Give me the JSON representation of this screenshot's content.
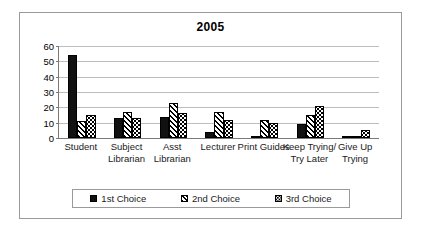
{
  "chart_data": {
    "type": "bar",
    "title": "2005",
    "xlabel": "",
    "ylabel": "",
    "ylim": [
      0,
      60
    ],
    "yticks": [
      0,
      10,
      20,
      30,
      40,
      50,
      60
    ],
    "grid": true,
    "legend_position": "bottom",
    "categories": [
      "Student",
      "Subject Librarian",
      "Asst Librarian",
      "Lecturer",
      "Print Guides",
      "Keep Trying/Try Later",
      "Give Up Trying"
    ],
    "series": [
      {
        "name": "1st Choice",
        "pattern": "solid-black",
        "values": [
          54,
          13,
          14,
          4,
          1,
          9,
          0.5
        ]
      },
      {
        "name": "2nd Choice",
        "pattern": "diagonal-stripes",
        "values": [
          11,
          17,
          23,
          17,
          12,
          15,
          1
        ]
      },
      {
        "name": "3rd Choice",
        "pattern": "dotted-checker",
        "values": [
          15,
          13,
          16,
          12,
          10,
          21,
          5
        ]
      }
    ]
  },
  "legend": {
    "items": [
      {
        "label": "1st Choice"
      },
      {
        "label": "2nd Choice"
      },
      {
        "label": "3rd Choice"
      }
    ]
  },
  "colors": {
    "series_1": "#111111",
    "series_2": "#000000",
    "series_3": "#000000",
    "gridline": "#bdbdbd",
    "axis": "#7a7a7a",
    "frame": "#9a9a9a",
    "text": "#1a1a1a"
  }
}
